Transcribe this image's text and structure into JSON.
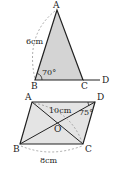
{
  "figure1": {
    "title": "Triangle ABC with extension CD",
    "vertices": {
      "A": "A",
      "B": "B",
      "C": "C",
      "D": "D"
    },
    "side_label": "6cm",
    "angle_label": "70°",
    "fill": "#d4d4d4",
    "stroke": "#222222"
  },
  "figure2": {
    "title": "Parallelogram ABCD with diagonals meeting at O",
    "vertices": {
      "A": "A",
      "B": "B",
      "C": "C",
      "D": "D",
      "O": "O"
    },
    "diagonal_label": "10cm",
    "angle_label": "75°",
    "base_label": "8cm",
    "fill": "#e4e4e4",
    "stroke": "#222222"
  }
}
